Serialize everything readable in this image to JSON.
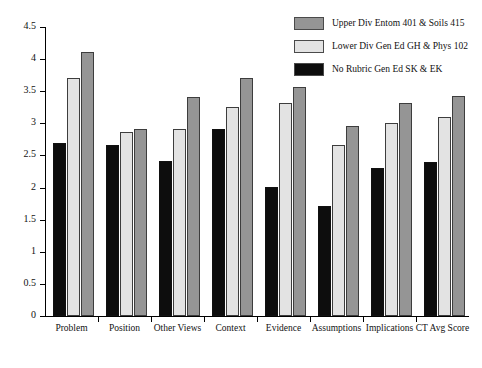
{
  "chart_data": {
    "type": "bar",
    "title": "",
    "subtitle": "",
    "xlabel": "",
    "ylabel": "",
    "ylim": [
      0,
      4.5
    ],
    "ytick_labels": [
      "0",
      "0.5",
      "1",
      "1.5",
      "2",
      "2.5",
      "3",
      "3.5",
      "4",
      "4.5"
    ],
    "ytick_values": [
      0,
      0.5,
      1,
      1.5,
      2,
      2.5,
      3,
      3.5,
      4,
      4.5
    ],
    "grid": false,
    "legend_position": "top-right",
    "categories": [
      "Problem",
      "Position",
      "Other Views",
      "Context",
      "Evidence",
      "Assumptions",
      "Implications",
      "CT Avg Score"
    ],
    "series": [
      {
        "name": "No Rubric Gen Ed SK & EK",
        "color": "#0d0d0d",
        "values": [
          2.7,
          2.66,
          2.41,
          2.91,
          2.01,
          1.71,
          2.31,
          2.4
        ]
      },
      {
        "name": "Lower Div Gen Ed GH & Phys 102",
        "color": "#e3e3e3",
        "values": [
          3.71,
          2.86,
          2.91,
          3.26,
          3.31,
          2.66,
          3.01,
          3.1
        ]
      },
      {
        "name": "Upper Div Entom 401 & Soils 415",
        "color": "#959595",
        "values": [
          4.11,
          2.91,
          3.41,
          3.71,
          3.56,
          2.96,
          3.31,
          3.43
        ]
      }
    ]
  },
  "legend": {
    "items": [
      {
        "label": "Upper Div Entom 401 & Soils 415",
        "color": "#959595"
      },
      {
        "label": "Lower Div Gen Ed GH & Phys 102",
        "color": "#e3e3e3"
      },
      {
        "label": "No Rubric Gen Ed SK & EK",
        "color": "#0d0d0d"
      }
    ]
  },
  "colors": {
    "upper_div": "#959595",
    "lower_div": "#e3e3e3",
    "no_rubric": "#0d0d0d",
    "axis": "#000000",
    "background": "#ffffff"
  }
}
